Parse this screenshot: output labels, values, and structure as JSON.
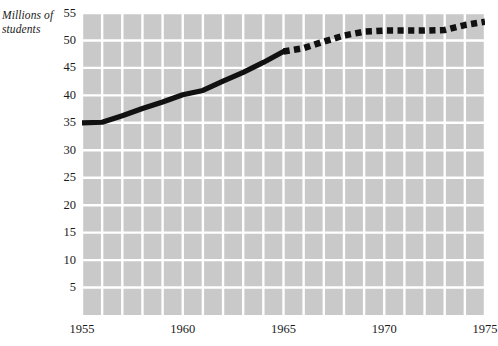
{
  "chart_data": {
    "type": "line",
    "title": "",
    "subtitle": "",
    "xlabel": "",
    "ylabel": "Millions of students",
    "ylabel_lines": [
      "Millions of",
      "students"
    ],
    "xlim": [
      1955,
      1975
    ],
    "ylim": [
      0,
      55
    ],
    "y_ticks": [
      55,
      50,
      45,
      40,
      35,
      30,
      25,
      20,
      15,
      10,
      5
    ],
    "y_tick_labels": [
      "55",
      "50",
      "45",
      "40",
      "35",
      "30",
      "25",
      "20",
      "15",
      "10",
      "5"
    ],
    "x_ticks": [
      1955,
      1960,
      1965,
      1970,
      1975
    ],
    "x_tick_labels": [
      "1955",
      "1960",
      "1965",
      "1970",
      "1975"
    ],
    "x_gridline_step": 1,
    "y_gridline_step": 5,
    "grid": true,
    "grid_color": "#ffffff",
    "plot_background": "#c9c9c9",
    "page_background": "#ffffff",
    "legend": false,
    "legend_position": "none",
    "series": [
      {
        "name": "Actual enrollment",
        "style": "solid",
        "color": "#111111",
        "x": [
          1955,
          1956,
          1957,
          1958,
          1959,
          1960,
          1961,
          1962,
          1963,
          1964,
          1965
        ],
        "values": [
          35.0,
          35.1,
          36.3,
          37.6,
          38.8,
          40.1,
          40.9,
          42.6,
          44.2,
          46.0,
          48.0
        ]
      },
      {
        "name": "Projected enrollment",
        "style": "dashed",
        "color": "#111111",
        "x": [
          1965,
          1966,
          1967,
          1968,
          1969,
          1970,
          1971,
          1972,
          1973,
          1974,
          1975
        ],
        "values": [
          48.0,
          48.6,
          49.8,
          50.9,
          51.6,
          51.8,
          51.8,
          51.8,
          51.9,
          52.8,
          53.4
        ]
      }
    ]
  }
}
